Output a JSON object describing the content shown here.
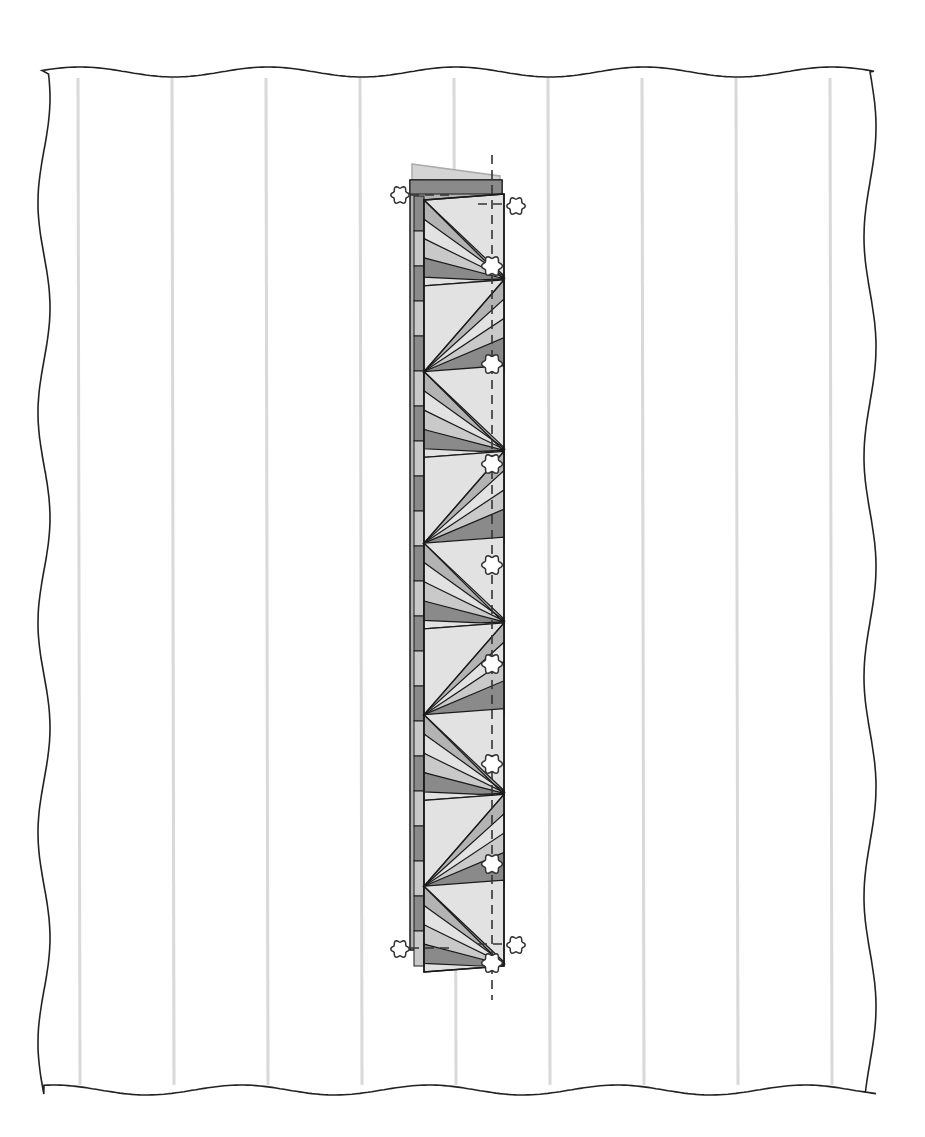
{
  "diagram": {
    "type": "quilt-assembly-illustration",
    "background_panel": {
      "fill": "#ffffff",
      "edge_stroke": "#222222",
      "edge_style": "wavy",
      "seam_lines": {
        "color": "#d9d9d9",
        "x_positions": [
          78,
          172,
          266,
          360,
          454,
          548,
          642,
          736,
          830
        ]
      }
    },
    "strip": {
      "block_count": 9,
      "colors": {
        "light": "#e2e2e2",
        "medium_light": "#c9c9c9",
        "medium": "#b3b3b3",
        "dark": "#8a8a8a",
        "outline": "#1a1a1a",
        "header_tab": "#d4d4d4"
      }
    },
    "pins": {
      "count": 12,
      "fill": "#ffffff",
      "stroke": "#333333"
    },
    "guide_line": {
      "style": "dashed",
      "color": "#333333"
    }
  }
}
